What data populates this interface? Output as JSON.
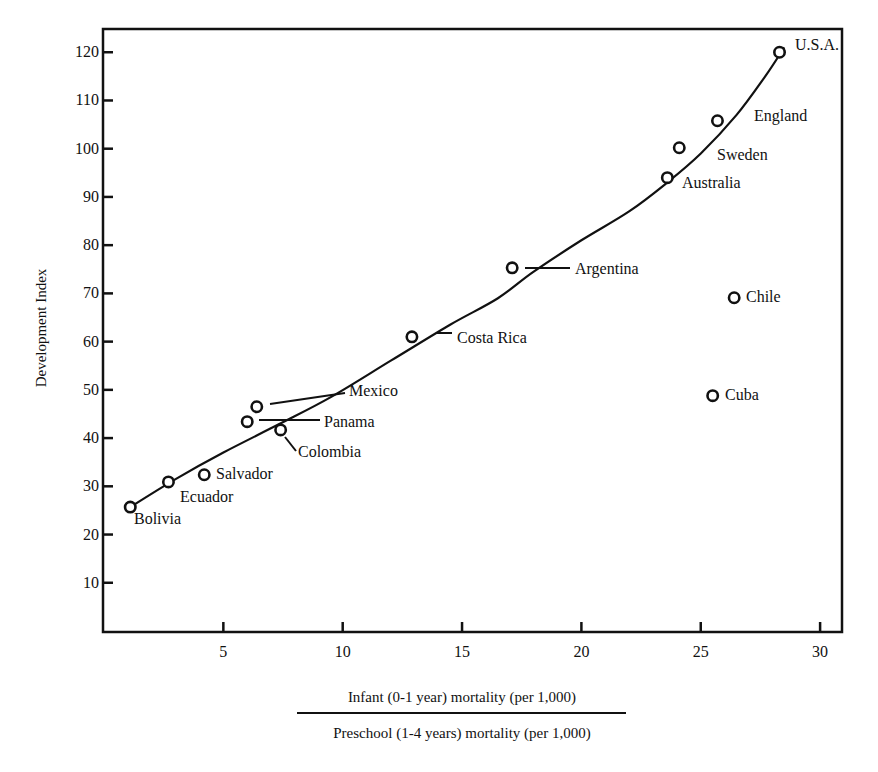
{
  "chart_data": {
    "type": "scatter",
    "title": "",
    "xlabel": {
      "numerator": "Infant (0-1 year) mortality (per 1,000)",
      "denominator": "Preschool (1-4 years) mortality (per 1,000)"
    },
    "ylabel": "Development Index",
    "xlim": [
      0,
      31
    ],
    "ylim": [
      0,
      125
    ],
    "xticks": [
      5,
      10,
      15,
      20,
      25,
      30
    ],
    "yticks": [
      10,
      20,
      30,
      40,
      50,
      60,
      70,
      80,
      90,
      100,
      110,
      120
    ],
    "grid": false,
    "legend": null,
    "marker": "open-circle",
    "points": [
      {
        "label": "Bolivia",
        "x": 1.1,
        "y": 25.7,
        "lx": 134,
        "ly": 524,
        "leader": null
      },
      {
        "label": "Ecuador",
        "x": 2.7,
        "y": 30.9,
        "lx": 180,
        "ly": 502,
        "leader": null
      },
      {
        "label": "Salvador",
        "x": 4.2,
        "y": 32.4,
        "lx": 216,
        "ly": 479,
        "leader": null
      },
      {
        "label": "Panama",
        "x": 6.0,
        "y": 43.4,
        "lx": 324,
        "ly": 427,
        "leader": [
          259,
          420,
          320,
          420
        ]
      },
      {
        "label": "Mexico",
        "x": 6.4,
        "y": 46.5,
        "lx": 349,
        "ly": 396,
        "leader": [
          270,
          404,
          345,
          393
        ]
      },
      {
        "label": "Colombia",
        "x": 7.4,
        "y": 41.7,
        "lx": 298,
        "ly": 457,
        "leader": [
          285,
          437,
          296,
          451
        ]
      },
      {
        "label": "Costa Rica",
        "x": 12.9,
        "y": 61.0,
        "lx": 457,
        "ly": 343,
        "leader": [
          437,
          333,
          452,
          333
        ]
      },
      {
        "label": "Argentina",
        "x": 17.1,
        "y": 75.3,
        "lx": 575,
        "ly": 274,
        "leader": [
          525,
          268,
          570,
          268
        ]
      },
      {
        "label": "Australia",
        "x": 23.6,
        "y": 94.0,
        "lx": 682,
        "ly": 188,
        "leader": null
      },
      {
        "label": "Sweden",
        "x": 24.1,
        "y": 100.2,
        "lx": 717,
        "ly": 160,
        "leader": null
      },
      {
        "label": "England",
        "x": 25.7,
        "y": 105.8,
        "lx": 754,
        "ly": 121,
        "leader": null
      },
      {
        "label": "U.S.A.",
        "x": 28.3,
        "y": 120.0,
        "lx": 795,
        "ly": 50,
        "leader": null
      },
      {
        "label": "Chile",
        "x": 26.4,
        "y": 69.1,
        "lx": 746,
        "ly": 302,
        "leader": null
      },
      {
        "label": "Cuba",
        "x": 25.5,
        "y": 48.8,
        "lx": 725,
        "ly": 400,
        "leader": null
      }
    ],
    "trend_curve": {
      "description": "Freehand smooth curve fitted through the main cluster (Chile and Cuba are outliers)",
      "points": [
        [
          1.1,
          25.7
        ],
        [
          3.0,
          31.5
        ],
        [
          5.0,
          37.0
        ],
        [
          7.3,
          42.8
        ],
        [
          9.5,
          48.5
        ],
        [
          12.0,
          56.0
        ],
        [
          14.5,
          63.5
        ],
        [
          16.5,
          69.0
        ],
        [
          18.0,
          74.5
        ],
        [
          20.0,
          81.0
        ],
        [
          22.0,
          87.0
        ],
        [
          23.6,
          93.0
        ],
        [
          25.0,
          99.0
        ],
        [
          26.5,
          107.0
        ],
        [
          27.7,
          115.0
        ],
        [
          28.5,
          121.0
        ]
      ]
    }
  }
}
